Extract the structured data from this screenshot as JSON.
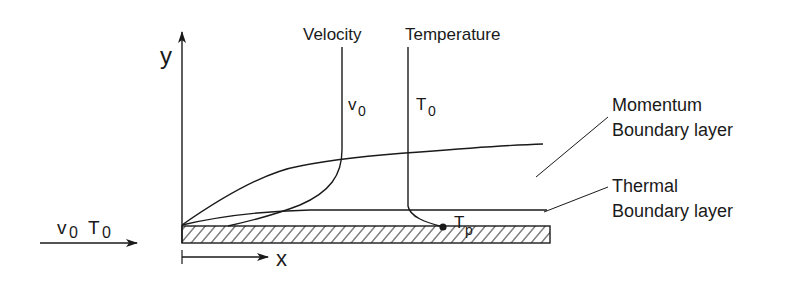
{
  "diagram": {
    "title_labels": {
      "velocity": "Velocity",
      "temperature": "Temperature"
    },
    "axes": {
      "y_label": "y",
      "x_label": "x"
    },
    "profile_labels": {
      "v0_base": "v",
      "v0_sub": "0",
      "t0_base": "T",
      "t0_sub": "0",
      "tp_base": "T",
      "tp_sub": "p"
    },
    "freestream": {
      "v_base": "v",
      "v_sub": "0",
      "t_base": "T",
      "t_sub": "0"
    },
    "annotations": {
      "momentum_line1": "Momentum",
      "momentum_line2": "Boundary layer",
      "thermal_line1": "Thermal",
      "thermal_line2": "Boundary layer"
    },
    "colors": {
      "ink": "#1a1a1a",
      "background": "#ffffff"
    }
  }
}
